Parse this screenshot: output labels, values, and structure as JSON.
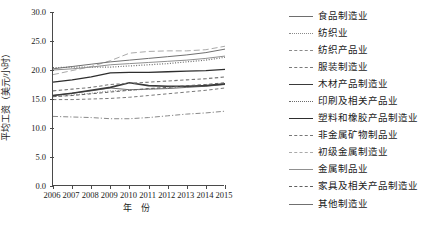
{
  "chart_data": {
    "type": "line",
    "title": "",
    "xlabel": "年  份",
    "ylabel": "平均工资（美元/小时）",
    "categories": [
      2006,
      2007,
      2008,
      2009,
      2010,
      2011,
      2012,
      2013,
      2014,
      2015
    ],
    "xtick_labels": [
      "2006",
      "2007",
      "2008",
      "2009",
      "2010",
      "2011",
      "2012",
      "2013",
      "2014",
      "2015"
    ],
    "ytick_labels": [
      "30.0",
      "25.0",
      "20.0",
      "15.0",
      "10.0",
      "5.0",
      "0.0"
    ],
    "ytick_values": [
      30.0,
      25.0,
      20.0,
      15.0,
      10.0,
      5.0,
      0.0
    ],
    "ylim": [
      0.0,
      30.0
    ],
    "xlim": [
      2006,
      2015
    ],
    "grid": false,
    "legend_position": "right",
    "series": [
      {
        "name": "食品制造业",
        "style": "solid",
        "color": "#6e6e6e",
        "width": 1.0,
        "values": [
          15.6,
          16.0,
          16.4,
          16.9,
          16.6,
          16.7,
          16.8,
          17.0,
          17.2,
          17.5
        ]
      },
      {
        "name": "纺织业",
        "style": "dotted",
        "color": "#8a8a8a",
        "width": 1.0,
        "values": [
          15.4,
          15.7,
          16.0,
          16.4,
          16.5,
          16.7,
          16.9,
          17.1,
          17.3,
          17.6
        ]
      },
      {
        "name": "纺织产品业",
        "style": "dashdot",
        "color": "#8a8a8a",
        "width": 1.0,
        "values": [
          12.0,
          11.9,
          11.8,
          11.6,
          11.6,
          11.8,
          12.1,
          12.4,
          12.6,
          12.9
        ]
      },
      {
        "name": "服装制造业",
        "style": "dashed",
        "color": "#7a7a7a",
        "width": 1.0,
        "values": [
          14.9,
          14.9,
          15.0,
          15.1,
          15.3,
          15.6,
          15.9,
          16.2,
          16.5,
          16.9
        ]
      },
      {
        "name": "木材产品制造业",
        "style": "solid",
        "color": "#3a3a3a",
        "width": 1.6,
        "values": [
          15.6,
          16.0,
          16.5,
          17.0,
          17.8,
          17.3,
          17.2,
          17.2,
          17.3,
          17.6
        ]
      },
      {
        "name": "印刷及相关产品业",
        "style": "dotted",
        "color": "#6b6b6b",
        "width": 1.2,
        "values": [
          20.4,
          20.5,
          20.5,
          20.5,
          20.7,
          20.9,
          21.1,
          21.4,
          21.7,
          22.2
        ]
      },
      {
        "name": "塑料和橡胶产品制造业",
        "style": "solid",
        "color": "#2e2e2e",
        "width": 1.3,
        "values": [
          17.9,
          18.3,
          18.8,
          19.5,
          19.6,
          19.6,
          19.7,
          19.8,
          19.9,
          20.1
        ]
      },
      {
        "name": "非金属矿物制品业",
        "style": "dashed",
        "color": "#777777",
        "width": 1.1,
        "values": [
          16.4,
          16.7,
          17.0,
          17.5,
          17.7,
          17.9,
          18.1,
          18.3,
          18.5,
          18.8
        ]
      },
      {
        "name": "初级金属制造业",
        "style": "dashed-long",
        "color": "#aaaaaa",
        "width": 1.0,
        "values": [
          19.2,
          19.9,
          20.6,
          21.6,
          22.9,
          23.2,
          23.3,
          23.3,
          23.5,
          24.1
        ]
      },
      {
        "name": "金属制品业",
        "style": "solid",
        "color": "#909090",
        "width": 1.0,
        "values": [
          20.0,
          20.2,
          20.5,
          20.9,
          21.1,
          21.3,
          21.5,
          21.7,
          22.0,
          22.4
        ]
      },
      {
        "name": "家具及相关产品制造业",
        "style": "dashed",
        "color": "#606060",
        "width": 1.0,
        "values": [
          15.4,
          15.6,
          15.9,
          16.2,
          16.5,
          16.8,
          17.0,
          17.3,
          17.5,
          17.8
        ]
      },
      {
        "name": "其他制造业",
        "style": "solid",
        "color": "#707070",
        "width": 1.0,
        "values": [
          20.2,
          20.6,
          21.0,
          21.4,
          21.7,
          22.0,
          22.3,
          22.6,
          23.0,
          23.6
        ]
      }
    ]
  },
  "legend": {
    "items": [
      {
        "label": "食品制造业"
      },
      {
        "label": "纺织业"
      },
      {
        "label": "纺织产品业"
      },
      {
        "label": "服装制造业"
      },
      {
        "label": "木材产品制造业"
      },
      {
        "label": "印刷及相关产品业"
      },
      {
        "label": "塑料和橡胶产品制造业"
      },
      {
        "label": "非金属矿物制品业"
      },
      {
        "label": "初级金属制造业"
      },
      {
        "label": "金属制品业"
      },
      {
        "label": "家具及相关产品制造业"
      },
      {
        "label": "其他制造业"
      }
    ]
  }
}
